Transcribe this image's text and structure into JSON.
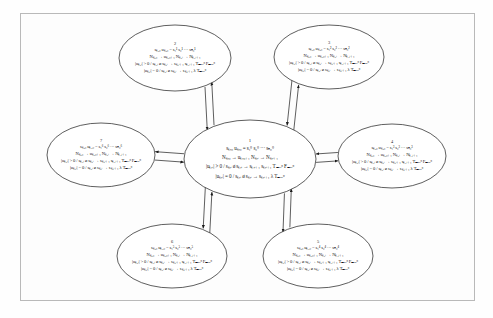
{
  "figure": {
    "type": "state-transition-diagram",
    "background_color": "#fefefe",
    "frame_color": "#b9b9b9",
    "ink_color": "#1a1a1a",
    "layout": "one central ellipse node surrounded by six satellite ellipse nodes, each connected to the center by a pair of anti-parallel arrows",
    "node_count": 7,
    "edge_count": 6,
    "edge_style": "double-line bidirectional arrow pair"
  },
  "nodes": [
    {
      "id": "node-1",
      "number": "1",
      "role": "center",
      "cx": 250,
      "cy": 159,
      "rx": 66,
      "ry": 39,
      "lines": [
        "sₖ,₀     uₖ,₀ = s₁⁰ s₂⁰ ··· sₙ₀⁰",
        "Nₖ,₀ → uₖ,₀₊₁ Nₖ,ᵢ → Nₖ,ᵢ₊₁",
        "|uₖ,ᵢ| > 0 / sₖ,ᵢ ø sₖ,ᵢ → sₖ,ᵢ₊₁ sₖ,ᵢ₊₁ Tₘₐₓᵖ Fₘₐₓᵖ",
        "|uₖ,ᵢ| = 0 / sₖ,ᵢ ø sₖ,ᵢ → sₖ,ᵢ₊₁ λ Tₘₐₓᵖ"
      ]
    },
    {
      "id": "node-2",
      "number": "2",
      "role": "satellite-top-left",
      "cx": 175,
      "cy": 58,
      "rx": 56,
      "ry": 33,
      "lines": [
        "sₖ,₀     uₖ,₀ = s₁¹ s₂¹ ··· sₙ₀¹",
        "Nₖ,₀ → uₖ,₀₊₁ Nₖ,ᵢ → Nₖ,ᵢ₊₁",
        "|uₖ,ᵢ| > 0 / sₖ,ᵢ ø sₖ,ᵢ → sₖ,ᵢ₊₁ sₖ,ᵢ₊₁ Tₘₐₓᵖ Fₘₐₓᵖ",
        "|uₖ,ᵢ| = 0 / sₖ,ᵢ ø sₖ,ᵢ → sₖ,ᵢ₊₁ λ Tₘₐₓᵖ"
      ]
    },
    {
      "id": "node-3",
      "number": "3",
      "role": "satellite-top-right",
      "cx": 329,
      "cy": 57,
      "rx": 55,
      "ry": 32,
      "lines": [
        "sₖ,₀     uₖ,₀ = s₁² s₂² ··· sₙ₀²",
        "Nₖ,₀ → uₖ,₀₊₁ Nₖ,ᵢ → Nₖ,ᵢ₊₁",
        "|uₖ,ᵢ| > 0 / sₖ,ᵢ ø sₖ,ᵢ → sₖ,ᵢ₊₁ sₖ,ᵢ₊₁ Tₘₐₓᵖ Fₘₐₓᵖ",
        "|uₖ,ᵢ| = 0 / sₖ,ᵢ ø sₖ,ᵢ → sₖ,ᵢ₊₁ λ Tₘₐₓᵖ"
      ]
    },
    {
      "id": "node-4",
      "number": "4",
      "role": "satellite-right",
      "cx": 392,
      "cy": 156,
      "rx": 54,
      "ry": 32,
      "lines": [
        "sₖ,₀     uₖ,₀ = s₁³ s₂³ ··· sₙ₀³",
        "Nₖ,₀ → uₖ,₀₊₁ Nₖ,ᵢ → Nₖ,ᵢ₊₁",
        "|uₖ,ᵢ| > 0 / sₖ,ᵢ ø sₖ,ᵢ → sₖ,ᵢ₊₁ sₖ,ᵢ₊₁ Tₘₐₓᵖ Fₘₐₓᵖ",
        "|uₖ,ᵢ| = 0 / sₖ,ᵢ ø sₖ,ᵢ → sₖ,ᵢ₊₁ λ Tₘₐₓᵖ"
      ]
    },
    {
      "id": "node-5",
      "number": "5",
      "role": "satellite-bottom-right",
      "cx": 318,
      "cy": 256,
      "rx": 55,
      "ry": 32,
      "lines": [
        "sₖ,₀     uₖ,₀ = s₁⁴ s₂⁴ ··· sₙ₀⁴",
        "Nₖ,₀ → uₖ,₀₊₁ Nₖ,ᵢ → Nₖ,ᵢ₊₁",
        "|uₖ,ᵢ| > 0 / sₖ,ᵢ ø sₖ,ᵢ → sₖ,ᵢ₊₁ sₖ,ᵢ₊₁ Tₘₐₓᵖ Fₘₐₓᵖ",
        "|uₖ,ᵢ| = 0 / sₖ,ᵢ ø sₖ,ᵢ → sₖ,ᵢ₊₁ λ Tₘₐₓᵖ"
      ]
    },
    {
      "id": "node-6",
      "number": "6",
      "role": "satellite-bottom-left",
      "cx": 172,
      "cy": 256,
      "rx": 55,
      "ry": 32,
      "lines": [
        "sₖ,₀     uₖ,₀ = s₁⁵ s₂⁵ ··· sₙ₀⁵",
        "Nₖ,₀ → uₖ,₀₊₁ Nₖ,ᵢ → Nₖ,ᵢ₊₁",
        "|uₖ,ᵢ| > 0 / sₖ,ᵢ ø sₖ,ᵢ → sₖ,ᵢ₊₁ sₖ,ᵢ₊₁ Tₘₐₓᵖ Fₘₐₓᵖ",
        "|uₖ,ᵢ| = 0 / sₖ,ᵢ ø sₖ,ᵢ → sₖ,ᵢ₊₁ λ Tₘₐₓᵖ"
      ]
    },
    {
      "id": "node-7",
      "number": "7",
      "role": "satellite-left",
      "cx": 101,
      "cy": 155,
      "rx": 54,
      "ry": 32,
      "lines": [
        "sₖ,₀     uₖ,₀ = s₁⁶ s₂⁶ ··· sₙ₀⁶",
        "Nₖ,₀ → uₖ,₀₊₁ Nₖ,ᵢ → Nₖ,ᵢ₊₁",
        "|uₖ,ᵢ| > 0 / sₖ,ᵢ ø sₖ,ᵢ → sₖ,ᵢ₊₁ sₖ,ᵢ₊₁ Tₘₐₓᵖ Fₘₐₓᵖ",
        "|uₖ,ᵢ| = 0 / sₖ,ᵢ ø sₖ,ᵢ → sₖ,ᵢ₊₁ λ Tₘₐₓᵖ"
      ]
    }
  ],
  "edges": [
    {
      "id": "edge-1-2",
      "from": "node-1",
      "to": "node-2",
      "bidirectional": true
    },
    {
      "id": "edge-1-3",
      "from": "node-1",
      "to": "node-3",
      "bidirectional": true
    },
    {
      "id": "edge-1-4",
      "from": "node-1",
      "to": "node-4",
      "bidirectional": true
    },
    {
      "id": "edge-1-5",
      "from": "node-1",
      "to": "node-5",
      "bidirectional": true
    },
    {
      "id": "edge-1-6",
      "from": "node-1",
      "to": "node-6",
      "bidirectional": true
    },
    {
      "id": "edge-1-7",
      "from": "node-1",
      "to": "node-7",
      "bidirectional": true
    }
  ]
}
